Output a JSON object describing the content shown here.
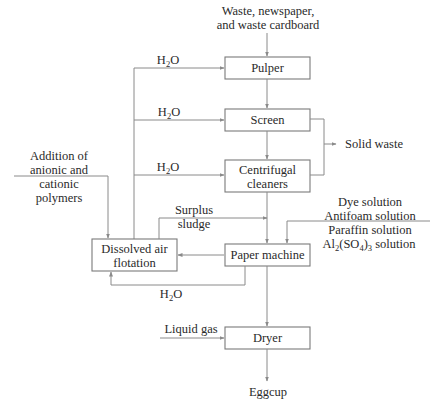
{
  "diagram": {
    "type": "process-flow",
    "inputs": {
      "top_line1": "Waste, newspaper,",
      "top_line2": "and waste cardboard",
      "polymers": [
        "Addition of",
        "anionic and",
        "cationic",
        "polymers"
      ],
      "additives": [
        "Dye solution",
        "Antifoam solution",
        "Paraffin solution"
      ],
      "alum": {
        "prefix": "Al",
        "sub1": "2",
        "mid": "(SO",
        "sub2": "4",
        "close": ")",
        "sub3": "3",
        "suffix": " solution"
      },
      "liquid_gas": "Liquid gas"
    },
    "water": {
      "h": "H",
      "sub": "2",
      "o": "O"
    },
    "nodes": {
      "pulper": "Pulper",
      "screen": "Screen",
      "cleaners_line1": "Centrifugal",
      "cleaners_line2": "cleaners",
      "paper_machine": "Paper machine",
      "daf_line1": "Dissolved air",
      "daf_line2": "flotation",
      "dryer": "Dryer"
    },
    "outputs": {
      "solid_waste": "Solid waste",
      "surplus_line1": "Surplus",
      "surplus_line2": "sludge",
      "product": "Eggcup"
    },
    "colors": {
      "line": "#8a8a8a",
      "text": "#2a2a2a",
      "box_border": "#7a7a7a"
    }
  }
}
